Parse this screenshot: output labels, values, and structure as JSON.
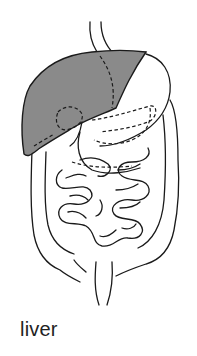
{
  "diagram": {
    "highlighted_organ": "liver",
    "highlight_color": "#8a8a8a",
    "outline_color": "#1a1a1a",
    "organs": [
      "esophagus",
      "liver",
      "stomach",
      "gallbladder",
      "pancreas",
      "duodenum",
      "small intestine",
      "large intestine",
      "rectum"
    ]
  },
  "caption": {
    "label": "liver"
  }
}
